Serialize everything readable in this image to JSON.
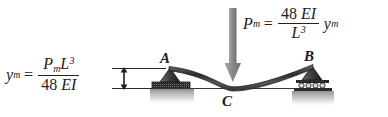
{
  "figure": {
    "background_color": "#ffffff",
    "beam_color": "#3a3a3a",
    "arrow_color": "#8a8a8a",
    "support_color": "#4a4a4a",
    "ground_color": "#9a9a9a"
  },
  "equation_left": {
    "lhs_var": "y",
    "lhs_sub": "m",
    "equals": "=",
    "numerator": {
      "p": "P",
      "p_sub": "m",
      "l": "L",
      "l_sup": "3"
    },
    "denominator": {
      "num": "48",
      "ei": "EI"
    },
    "plain": "y_m = P_m L^3 / (48 EI)"
  },
  "equation_right": {
    "lhs_var": "P",
    "lhs_sub": "m",
    "equals": "=",
    "numerator": {
      "num": "48",
      "ei": "EI"
    },
    "denominator": {
      "l": "L",
      "l_sup": "3"
    },
    "trailing_var": "y",
    "trailing_sub": "m",
    "plain": "P_m = 48 EI / L^3 * y_m"
  },
  "labels": {
    "point_a": "A",
    "point_b": "B",
    "point_c": "C"
  },
  "annotations": {
    "load_arrow_name": "applied-load-arrow",
    "dimension_name": "deflection-dimension-arrow",
    "support_a_type": "pin-support",
    "support_b_type": "roller-support",
    "roller_count": 4
  }
}
